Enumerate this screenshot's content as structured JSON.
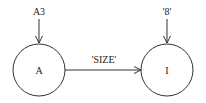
{
  "diagram": {
    "type": "state-transition",
    "nodes": [
      {
        "id": "A",
        "label": "A",
        "input_label": "A3"
      },
      {
        "id": "I",
        "label": "I",
        "input_label": "'8'"
      }
    ],
    "edges": [
      {
        "from": "A",
        "to": "I",
        "label": "'SIZE'"
      }
    ],
    "colors": {
      "stroke": "#333333",
      "text": "#222222",
      "background": "#ffffff"
    }
  }
}
